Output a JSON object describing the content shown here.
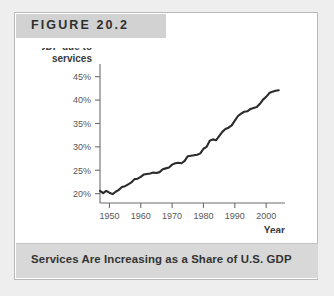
{
  "figure": {
    "label": "FIGURE 20.2",
    "caption": "Services Are Increasing as a Share of U.S. GDP"
  },
  "chart_data": {
    "type": "line",
    "title": "",
    "xlabel": "Year",
    "ylabel": "GDP due to services",
    "ylabel_line1": "GDP due to",
    "ylabel_line2": "services",
    "xlim": [
      1947,
      2006
    ],
    "ylim": [
      18,
      46
    ],
    "grid": false,
    "legend": "none",
    "ytick_labels": [
      "45%",
      "40%",
      "35%",
      "30%",
      "25%",
      "20%"
    ],
    "ytick_values": [
      45,
      40,
      35,
      30,
      25,
      20
    ],
    "xtick_labels": [
      "1950",
      "1960",
      "1970",
      "1980",
      "1990",
      "2000"
    ],
    "xtick_values": [
      1950,
      1960,
      1970,
      1980,
      1990,
      2000
    ],
    "series": [
      {
        "name": "GDP due to services",
        "x": [
          1947,
          1948,
          1949,
          1950,
          1951,
          1952,
          1953,
          1954,
          1955,
          1956,
          1957,
          1958,
          1959,
          1960,
          1961,
          1962,
          1963,
          1964,
          1965,
          1966,
          1967,
          1968,
          1969,
          1970,
          1971,
          1972,
          1973,
          1974,
          1975,
          1976,
          1977,
          1978,
          1979,
          1980,
          1981,
          1982,
          1983,
          1984,
          1985,
          1986,
          1987,
          1988,
          1989,
          1990,
          1991,
          1992,
          1993,
          1994,
          1995,
          1996,
          1997,
          1998,
          1999,
          2000,
          2001,
          2002,
          2003,
          2004
        ],
        "values": [
          20.6,
          20.1,
          20.6,
          20.2,
          19.9,
          20.4,
          20.8,
          21.4,
          21.6,
          22.0,
          22.4,
          23.1,
          23.2,
          23.6,
          24.1,
          24.2,
          24.3,
          24.5,
          24.4,
          24.6,
          25.2,
          25.4,
          25.6,
          26.2,
          26.5,
          26.6,
          26.5,
          27.0,
          28.0,
          28.1,
          28.2,
          28.3,
          28.6,
          29.6,
          30.0,
          31.3,
          31.6,
          31.4,
          32.3,
          33.2,
          33.8,
          34.1,
          34.6,
          35.6,
          36.6,
          37.1,
          37.5,
          37.6,
          38.1,
          38.3,
          38.5,
          39.2,
          40.1,
          40.7,
          41.5,
          41.8,
          42.0,
          42.1
        ]
      }
    ]
  }
}
